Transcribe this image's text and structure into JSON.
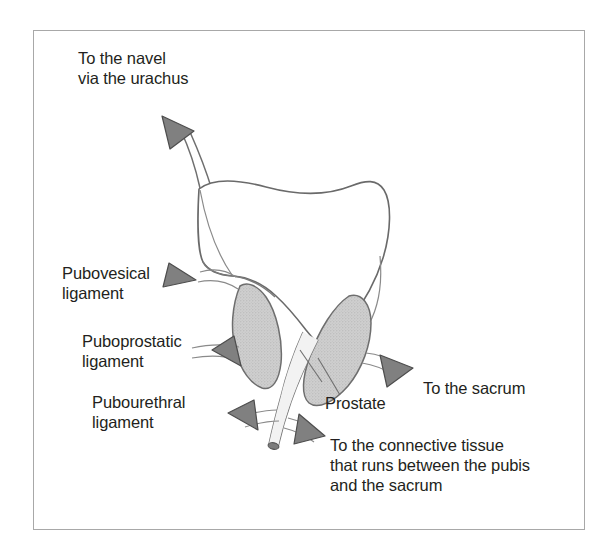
{
  "figure": {
    "kind": "anatomical-diagram",
    "colors": {
      "frame_border": "#a8a8a8",
      "background": "#ffffff",
      "outline": "#5a5a5a",
      "arrow_fill": "#808080",
      "arrow_stroke": "#4d4d4d",
      "prostate_fill": "#c9c9c9",
      "prostate_stroke": "#6e6e6e",
      "bladder_fill": "#ffffff",
      "text": "#231f20"
    }
  },
  "labels": {
    "navel": "To the navel\nvia the urachus",
    "pubovesical": "Pubovesical\nligament",
    "puboprostatic": "Puboprostatic\nligament",
    "pubourethral": "Pubourethral\nligament",
    "sacrum": "To the sacrum",
    "prostate": "Prostate",
    "connective": "To the connective tissue\nthat runs between the pubis\nand the sacrum"
  },
  "structures": {
    "bladder": "urinary-bladder",
    "urachus": "urachus",
    "prostate_left_lobe": "prostate-lobe-left",
    "prostate_right_lobe": "prostate-lobe-right",
    "urethra": "urethra"
  },
  "arrows": [
    {
      "name": "arrow-urachus",
      "direction": "up-left",
      "points_to": "navel"
    },
    {
      "name": "arrow-pubovesical",
      "direction": "up-left",
      "points_to": "pubovesical ligament"
    },
    {
      "name": "arrow-puboprostatic",
      "direction": "left",
      "points_to": "puboprostatic ligament"
    },
    {
      "name": "arrow-pubourethral",
      "direction": "down-left",
      "points_to": "pubourethral ligament"
    },
    {
      "name": "arrow-sacrum",
      "direction": "down-right",
      "points_to": "sacrum"
    },
    {
      "name": "arrow-connective",
      "direction": "down-right",
      "points_to": "connective tissue"
    }
  ]
}
